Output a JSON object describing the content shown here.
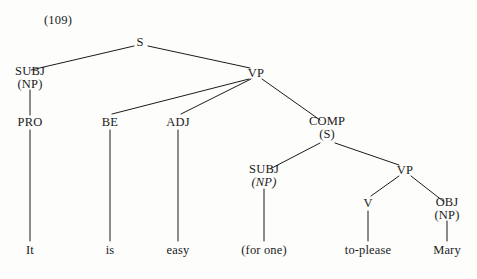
{
  "figure": {
    "example_number": "(109)",
    "example_number_pos": {
      "x": 44,
      "y": 20
    },
    "ink_color": "#1b1b1b",
    "background_color": "#fdfdfc",
    "width": 477,
    "height": 279
  },
  "tree": {
    "nodes": [
      {
        "id": "s-root",
        "cat": "S",
        "sub": "",
        "sub_italic": false,
        "x": 140,
        "y": 42
      },
      {
        "id": "subj-outer",
        "cat": "SUBJ",
        "sub": "(NP)",
        "sub_italic": false,
        "x": 30,
        "y": 78
      },
      {
        "id": "vp-outer",
        "cat": "VP",
        "sub": "",
        "sub_italic": false,
        "x": 256,
        "y": 73
      },
      {
        "id": "pro",
        "cat": "PRO",
        "sub": "",
        "sub_italic": false,
        "x": 30,
        "y": 122
      },
      {
        "id": "be",
        "cat": "BE",
        "sub": "",
        "sub_italic": false,
        "x": 110,
        "y": 122
      },
      {
        "id": "adj",
        "cat": "ADJ",
        "sub": "",
        "sub_italic": false,
        "x": 178,
        "y": 122
      },
      {
        "id": "comp",
        "cat": "COMP",
        "sub": "(S)",
        "sub_italic": false,
        "x": 327,
        "y": 128
      },
      {
        "id": "subj-inner",
        "cat": "SUBJ",
        "sub": "(NP)",
        "sub_italic": true,
        "x": 264,
        "y": 176
      },
      {
        "id": "vp-inner",
        "cat": "VP",
        "sub": "",
        "sub_italic": false,
        "x": 405,
        "y": 170
      },
      {
        "id": "v",
        "cat": "V",
        "sub": "",
        "sub_italic": false,
        "x": 368,
        "y": 203
      },
      {
        "id": "obj",
        "cat": "OBJ",
        "sub": "(NP)",
        "sub_italic": false,
        "x": 447,
        "y": 209
      }
    ],
    "leaves": [
      {
        "id": "leaf-it",
        "text": "It",
        "x": 30,
        "y": 250
      },
      {
        "id": "leaf-is",
        "text": "is",
        "x": 110,
        "y": 250
      },
      {
        "id": "leaf-easy",
        "text": "easy",
        "x": 178,
        "y": 250
      },
      {
        "id": "leaf-for-one",
        "text": "(for one)",
        "x": 264,
        "y": 250
      },
      {
        "id": "leaf-to-please",
        "text": "to-please",
        "x": 368,
        "y": 250
      },
      {
        "id": "leaf-mary",
        "text": "Mary",
        "x": 447,
        "y": 250
      }
    ],
    "edges": [
      {
        "from": "s-root",
        "to": "subj-outer",
        "x1": 134,
        "y1": 46,
        "x2": 31,
        "y2": 70
      },
      {
        "from": "s-root",
        "to": "vp-outer",
        "x1": 148,
        "y1": 46,
        "x2": 250,
        "y2": 68
      },
      {
        "from": "subj-outer",
        "to": "pro",
        "x1": 30,
        "y1": 90,
        "x2": 30,
        "y2": 115
      },
      {
        "from": "vp-outer",
        "to": "be",
        "x1": 249,
        "y1": 79,
        "x2": 112,
        "y2": 114
      },
      {
        "from": "vp-outer",
        "to": "adj",
        "x1": 251,
        "y1": 79,
        "x2": 181,
        "y2": 114
      },
      {
        "from": "vp-outer",
        "to": "comp",
        "x1": 262,
        "y1": 79,
        "x2": 320,
        "y2": 120
      },
      {
        "from": "be",
        "to": "leaf-is",
        "x1": 110,
        "y1": 130,
        "x2": 110,
        "y2": 241
      },
      {
        "from": "adj",
        "to": "leaf-easy",
        "x1": 178,
        "y1": 130,
        "x2": 178,
        "y2": 241
      },
      {
        "from": "pro",
        "to": "leaf-it",
        "x1": 30,
        "y1": 130,
        "x2": 30,
        "y2": 241
      },
      {
        "from": "comp",
        "to": "subj-inner",
        "x1": 320,
        "y1": 143,
        "x2": 270,
        "y2": 169
      },
      {
        "from": "comp",
        "to": "vp-inner",
        "x1": 335,
        "y1": 143,
        "x2": 399,
        "y2": 165
      },
      {
        "from": "subj-inner",
        "to": "leaf-for-one",
        "x1": 264,
        "y1": 189,
        "x2": 264,
        "y2": 241
      },
      {
        "from": "vp-inner",
        "to": "v",
        "x1": 399,
        "y1": 176,
        "x2": 371,
        "y2": 196
      },
      {
        "from": "vp-inner",
        "to": "obj",
        "x1": 411,
        "y1": 176,
        "x2": 443,
        "y2": 201
      },
      {
        "from": "v",
        "to": "leaf-to-please",
        "x1": 368,
        "y1": 211,
        "x2": 368,
        "y2": 241
      },
      {
        "from": "obj",
        "to": "leaf-mary",
        "x1": 447,
        "y1": 221,
        "x2": 447,
        "y2": 241
      }
    ]
  }
}
